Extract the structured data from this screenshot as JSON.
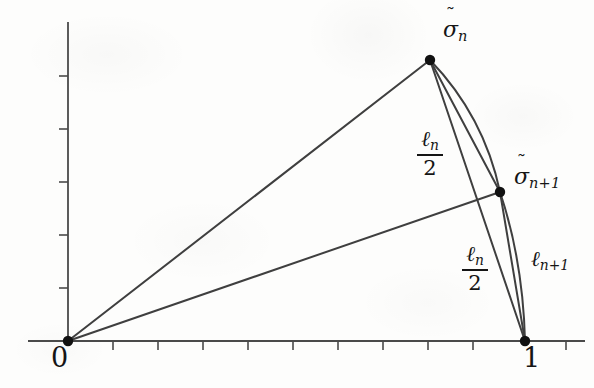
{
  "figure": {
    "width": 594,
    "height": 388,
    "background_color": "#fdfdfc",
    "ink_color": "#3a3a3a",
    "label_color": "#151515"
  },
  "axes": {
    "origin_px": [
      68,
      341
    ],
    "x_axis": {
      "start_px": [
        28,
        341
      ],
      "end_px": [
        585,
        341
      ],
      "tick_spacing_px": 45,
      "tick_count": 12,
      "tick_length_px": 8
    },
    "y_axis": {
      "start_px": [
        68,
        341
      ],
      "end_px": [
        68,
        22
      ],
      "tick_spacing_px": 53,
      "tick_count": 6,
      "tick_length_px": 8
    },
    "tick_labels": {
      "origin": "0",
      "unit_x": "1"
    }
  },
  "points": [
    {
      "id": "origin",
      "label": "0",
      "x_px": 68,
      "y_px": 341,
      "radius_px": 5
    },
    {
      "id": "unit",
      "label": "1",
      "x_px": 525,
      "y_px": 341,
      "radius_px": 5
    },
    {
      "id": "sigma_n",
      "label": "sigma_n",
      "x_px": 430,
      "y_px": 60,
      "radius_px": 5
    },
    {
      "id": "sigma_n1",
      "label": "sigma_n+1",
      "x_px": 500,
      "y_px": 192,
      "radius_px": 5
    }
  ],
  "segments": [
    {
      "name": "ray-origin-to-sigma-n",
      "from": "origin",
      "to": "sigma_n",
      "kind": "straight"
    },
    {
      "name": "ray-origin-to-sigma-n1",
      "from": "origin",
      "to": "sigma_n1",
      "kind": "straight"
    },
    {
      "name": "chord-sigma-n-to-sigma-n1",
      "from": "sigma_n",
      "to": "sigma_n1",
      "kind": "straight"
    },
    {
      "name": "chord-sigma-n-to-unit",
      "from": "sigma_n",
      "to": "unit",
      "kind": "straight"
    },
    {
      "name": "chord-sigma-n1-to-unit",
      "from": "sigma_n1",
      "to": "unit",
      "kind": "straight"
    },
    {
      "name": "arc-sigma-n-to-sigma-n1",
      "from": "sigma_n",
      "to": "sigma_n1",
      "kind": "arc",
      "bulge": "right"
    },
    {
      "name": "arc-sigma-n1-to-unit",
      "from": "sigma_n1",
      "to": "unit",
      "kind": "arc",
      "bulge": "right"
    }
  ],
  "labels": {
    "origin_number": "0",
    "unit_number": "1",
    "sigma_n": {
      "symbol": "σ",
      "accent": "˜",
      "subscript": "n"
    },
    "sigma_n_plus_1": {
      "symbol": "σ",
      "accent": "˜",
      "subscript": "n+1"
    },
    "ell_n_over_2_upper": {
      "numerator_symbol": "ℓ",
      "numerator_subscript": "n",
      "denominator": "2"
    },
    "ell_n_over_2_lower": {
      "numerator_symbol": "ℓ",
      "numerator_subscript": "n",
      "denominator": "2"
    },
    "ell_n_plus_1": {
      "symbol": "ℓ",
      "subscript": "n+1"
    }
  }
}
